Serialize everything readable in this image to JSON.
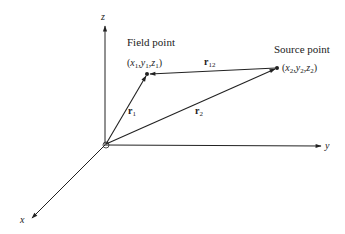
{
  "axes": {
    "x_label": "x",
    "y_label": "y",
    "z_label": "z"
  },
  "points": {
    "field": {
      "title": "Field point",
      "coords_open": "(",
      "x": "x",
      "xs": "1",
      "y": "y",
      "ys": "1",
      "z": "z",
      "zs": "1",
      "coords_close": ")"
    },
    "source": {
      "title": "Source point",
      "coords_open": "(",
      "x": "x",
      "xs": "2",
      "y": "y",
      "ys": "2",
      "z": "z",
      "zs": "2",
      "coords_close": ")"
    }
  },
  "vectors": {
    "r1": {
      "base": "r",
      "sub": "1"
    },
    "r2": {
      "base": "r",
      "sub": "2"
    },
    "r12": {
      "base": "r",
      "sub": "12"
    }
  },
  "colors": {
    "ink": "#222222",
    "background": "#ffffff"
  }
}
